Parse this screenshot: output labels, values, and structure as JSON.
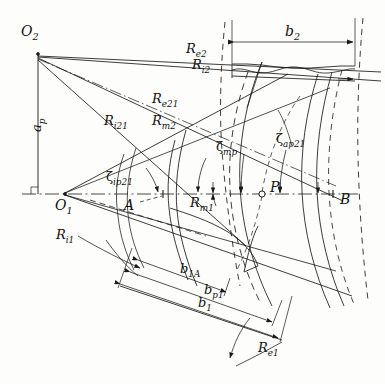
{
  "figure": {
    "kind": "engineering-geometry-diagram",
    "background_color": "#fdfdfc",
    "line_color": "#1a1a1a"
  },
  "points": {
    "O2": {
      "label": "O",
      "sub": "2",
      "x": 38,
      "y": 54,
      "marker": "vertex"
    },
    "O1": {
      "label": "O",
      "sub": "1",
      "x": 65,
      "y": 194,
      "marker": "vertex"
    },
    "A": {
      "label": "A",
      "sub": "",
      "x": 163,
      "y": 194,
      "marker": "point"
    },
    "B": {
      "label": "B",
      "sub": "",
      "x": 333,
      "y": 194,
      "marker": "point"
    },
    "P": {
      "label": "P",
      "sub": "",
      "x": 262,
      "y": 194,
      "marker": "open-circle"
    }
  },
  "radii_labels": [
    {
      "id": "Re2",
      "base": "R",
      "sub": "e2",
      "x": 186,
      "y": 42
    },
    {
      "id": "Ri2",
      "base": "R",
      "sub": "i2",
      "x": 192,
      "y": 58
    },
    {
      "id": "Re21",
      "base": "R",
      "sub": "e21",
      "x": 152,
      "y": 92
    },
    {
      "id": "Ri21",
      "base": "R",
      "sub": "i21",
      "x": 104,
      "y": 114
    },
    {
      "id": "Rm2",
      "base": "R",
      "sub": "m2",
      "x": 152,
      "y": 114
    },
    {
      "id": "Rm1",
      "base": "R",
      "sub": "m1",
      "x": 190,
      "y": 196
    },
    {
      "id": "Ri1",
      "base": "R",
      "sub": "i1",
      "x": 56,
      "y": 228
    },
    {
      "id": "Re1",
      "base": "R",
      "sub": "e1",
      "x": 258,
      "y": 341
    }
  ],
  "angle_labels": [
    {
      "id": "zeta_ip21",
      "glyph": "ζ",
      "sub": "ip21",
      "x": 106,
      "y": 172
    },
    {
      "id": "zeta_mp",
      "glyph": "ζ",
      "sub": "mp",
      "x": 216,
      "y": 142
    },
    {
      "id": "zeta_ap21",
      "glyph": "ζ",
      "sub": "ap21",
      "x": 276,
      "y": 134
    }
  ],
  "dimension_labels": [
    {
      "id": "ap",
      "base": "a",
      "sub": "p",
      "x": 30,
      "y": 122,
      "rotated": true
    },
    {
      "id": "b2",
      "base": "b",
      "sub": "2",
      "x": 287,
      "y": 26
    },
    {
      "id": "b1A",
      "base": "b",
      "sub": "1A",
      "x": 182,
      "y": 264
    },
    {
      "id": "bp1",
      "base": "b",
      "sub": "p1",
      "x": 206,
      "y": 285
    },
    {
      "id": "b1",
      "base": "b",
      "sub": "1",
      "x": 200,
      "y": 298
    }
  ],
  "markers": {
    "right_angle": {
      "x": 38,
      "y": 194,
      "size": 7
    }
  },
  "axes": {
    "horizontal_axis_y": 194,
    "vertical_axis_x": 38,
    "axis_style": "dash-dot"
  }
}
